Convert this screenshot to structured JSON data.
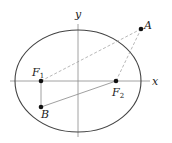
{
  "diagram": {
    "type": "ellipse-foci",
    "colors": {
      "ellipse": "#444444",
      "axes": "#8a8a8a",
      "dashed": "#9a9a9a",
      "solid_segment": "#888888",
      "point": "#111111"
    },
    "axes": {
      "x_label": "x",
      "y_label": "y"
    },
    "ellipse": {
      "cx": 78,
      "cy": 81,
      "rx": 63,
      "ry": 51
    },
    "points": [
      {
        "id": "F1",
        "label": "F",
        "subscript": "1",
        "x": 41,
        "y": 81
      },
      {
        "id": "F2",
        "label": "F",
        "subscript": "2",
        "x": 116,
        "y": 81
      },
      {
        "id": "A",
        "label": "A",
        "subscript": "",
        "x": 141,
        "y": 29
      },
      {
        "id": "B",
        "label": "B",
        "subscript": "",
        "x": 41,
        "y": 107
      }
    ],
    "segments": [
      {
        "from": "F1",
        "to": "A",
        "style": "dashed"
      },
      {
        "from": "F2",
        "to": "A",
        "style": "dashed"
      },
      {
        "from": "F1",
        "to": "B",
        "style": "solid"
      },
      {
        "from": "B",
        "to": "F2",
        "style": "solid"
      }
    ]
  }
}
